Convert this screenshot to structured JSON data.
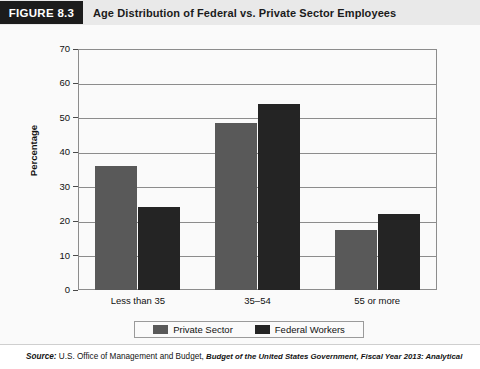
{
  "header": {
    "badge": "FIGURE 8.3",
    "title": "Age Distribution of Federal vs. Private Sector Employees"
  },
  "colors": {
    "private_sector": "#595959",
    "federal_workers": "#242424",
    "badge_background": "#1c1c1c",
    "header_background": "#e9e9e9",
    "axis": "#8c8c8c"
  },
  "chart_data": {
    "type": "bar",
    "title": "Age Distribution of Federal vs. Private Sector Employees",
    "xlabel": "",
    "ylabel": "Percentage",
    "categories": [
      "Less than 35",
      "35–54",
      "55 or more"
    ],
    "series": [
      {
        "name": "Private Sector",
        "values": [
          36,
          48.5,
          17.5
        ],
        "color": "#595959"
      },
      {
        "name": "Federal Workers",
        "values": [
          24,
          54,
          22
        ],
        "color": "#242424"
      }
    ],
    "ylim": [
      0,
      70
    ],
    "yticks": [
      0,
      10,
      20,
      30,
      40,
      50,
      60,
      70
    ],
    "ytick_labels": [
      "0",
      "10",
      "20",
      "30",
      "40",
      "50",
      "60",
      "70"
    ],
    "grid": true,
    "legend_position": "bottom"
  },
  "source": {
    "label": "Source:",
    "text": " U.S. Office of Management and Budget, ",
    "italic": "Budget of the United States Government, Fiscal Year 2013: Analytical"
  }
}
